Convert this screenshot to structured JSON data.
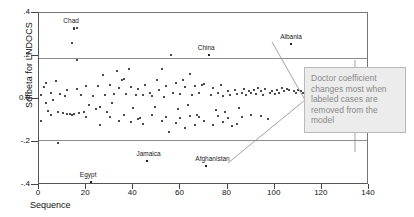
{
  "chart_data": {
    "type": "scatter",
    "title": "",
    "xlabel": "Sequence",
    "ylabel": "Sdfbeta for LNDOCS",
    "xlim": [
      0,
      140
    ],
    "ylim": [
      -0.4,
      0.4
    ],
    "xticks": [
      0,
      20,
      40,
      60,
      80,
      100,
      120,
      140
    ],
    "xtick_labels": [
      "0",
      "20",
      "40",
      "60",
      "80",
      "100",
      "120",
      "140"
    ],
    "yticks": [
      0.4,
      0.2,
      0.0,
      -0.2,
      -0.4
    ],
    "ytick_labels": [
      ".4",
      ".2",
      "0.0",
      "-.2",
      "-.4"
    ],
    "grid": false,
    "legend": "none",
    "reference_lines": [
      0.19,
      -0.19
    ],
    "annotations": [
      {
        "label": "Chad",
        "x": 15,
        "y": 0.33
      },
      {
        "label": "China",
        "x": 72,
        "y": 0.205
      },
      {
        "label": "Albania",
        "x": 107,
        "y": 0.255
      },
      {
        "label": "Jamaica",
        "x": 46,
        "y": -0.29
      },
      {
        "label": "Afghanistan",
        "x": 71,
        "y": -0.31
      },
      {
        "label": "Egypt",
        "x": 22,
        "y": -0.385
      }
    ],
    "points": [
      [
        1,
        0.02
      ],
      [
        1,
        -0.1
      ],
      [
        2,
        0.055
      ],
      [
        3,
        -0.02
      ],
      [
        3,
        0.075
      ],
      [
        4,
        -0.055
      ],
      [
        5,
        0.03
      ],
      [
        5,
        -0.075
      ],
      [
        6,
        -0.005
      ],
      [
        7,
        0.085
      ],
      [
        8,
        -0.205
      ],
      [
        8,
        -0.06
      ],
      [
        9,
        0.025
      ],
      [
        10,
        -0.065
      ],
      [
        11,
        0.015
      ],
      [
        12,
        -0.07
      ],
      [
        13,
        -0.07
      ],
      [
        14,
        -0.075
      ],
      [
        15,
        0.325
      ],
      [
        16,
        0.33
      ],
      [
        14,
        0.26
      ],
      [
        16,
        0.18
      ],
      [
        15,
        -0.07
      ],
      [
        16,
        0.045
      ],
      [
        17,
        -0.065
      ],
      [
        18,
        0.02
      ],
      [
        19,
        -0.06
      ],
      [
        20,
        0.06
      ],
      [
        21,
        -0.03
      ],
      [
        22,
        -0.385
      ],
      [
        23,
        0.015
      ],
      [
        24,
        -0.045
      ],
      [
        25,
        0.06
      ],
      [
        26,
        -0.035
      ],
      [
        27,
        0.11
      ],
      [
        28,
        0.02
      ],
      [
        29,
        -0.06
      ],
      [
        30,
        0.065
      ],
      [
        31,
        -0.02
      ],
      [
        32,
        0.025
      ],
      [
        33,
        0.13
      ],
      [
        34,
        0.05
      ],
      [
        35,
        0.09
      ],
      [
        36,
        0.095
      ],
      [
        37,
        0.025
      ],
      [
        38,
        0.14
      ],
      [
        39,
        0.055
      ],
      [
        40,
        -0.04
      ],
      [
        41,
        0.02
      ],
      [
        42,
        0.045
      ],
      [
        43,
        -0.09
      ],
      [
        44,
        0.02
      ],
      [
        45,
        0.065
      ],
      [
        46,
        -0.29
      ],
      [
        47,
        0.03
      ],
      [
        48,
        0.015
      ],
      [
        49,
        -0.035
      ],
      [
        50,
        0.09
      ],
      [
        51,
        0.04
      ],
      [
        52,
        0.14
      ],
      [
        53,
        0.01
      ],
      [
        54,
        0.06
      ],
      [
        55,
        -0.155
      ],
      [
        56,
        0.205
      ],
      [
        57,
        0.03
      ],
      [
        58,
        0.075
      ],
      [
        59,
        -0.045
      ],
      [
        60,
        0.025
      ],
      [
        61,
        0.09
      ],
      [
        62,
        0.055
      ],
      [
        63,
        -0.03
      ],
      [
        64,
        0.115
      ],
      [
        65,
        0.02
      ],
      [
        66,
        0.06
      ],
      [
        67,
        -0.075
      ],
      [
        68,
        0.03
      ],
      [
        69,
        0.065
      ],
      [
        70,
        0.07
      ],
      [
        71,
        -0.31
      ],
      [
        72,
        0.205
      ],
      [
        73,
        0.02
      ],
      [
        74,
        0.05
      ],
      [
        75,
        -0.05
      ],
      [
        76,
        0.03
      ],
      [
        77,
        0.065
      ],
      [
        78,
        0.015
      ],
      [
        79,
        -0.06
      ],
      [
        80,
        0.035
      ],
      [
        81,
        0.02
      ],
      [
        82,
        -0.125
      ],
      [
        83,
        0.04
      ],
      [
        84,
        0.025
      ],
      [
        85,
        -0.04
      ],
      [
        86,
        0.03
      ],
      [
        87,
        0.045
      ],
      [
        88,
        0.02
      ],
      [
        89,
        0.035
      ],
      [
        90,
        0.03
      ],
      [
        91,
        0.04
      ],
      [
        92,
        0.025
      ],
      [
        93,
        0.05
      ],
      [
        94,
        0.035
      ],
      [
        95,
        0.02
      ],
      [
        96,
        0.045
      ],
      [
        97,
        -0.095
      ],
      [
        98,
        0.03
      ],
      [
        99,
        0.035
      ],
      [
        100,
        0.025
      ],
      [
        101,
        0.04
      ],
      [
        102,
        0.03
      ],
      [
        103,
        0.05
      ],
      [
        104,
        0.035
      ],
      [
        105,
        0.045
      ],
      [
        106,
        0.04
      ],
      [
        107,
        0.255
      ],
      [
        108,
        0.035
      ],
      [
        109,
        0.03
      ],
      [
        110,
        0.04
      ],
      [
        111,
        0.035
      ],
      [
        112,
        0.03
      ],
      [
        113,
        0.035
      ],
      [
        114,
        0.03
      ],
      [
        115,
        0.025
      ],
      [
        116,
        0.03
      ],
      [
        117,
        0.025
      ],
      [
        118,
        0.02
      ],
      [
        119,
        0.025
      ],
      [
        120,
        0.02
      ],
      [
        121,
        0.015
      ],
      [
        122,
        0.015
      ],
      [
        123,
        0.01
      ],
      [
        124,
        0.005
      ],
      [
        125,
        0.0
      ],
      [
        26,
        -0.12
      ],
      [
        34,
        -0.1
      ],
      [
        39,
        -0.105
      ],
      [
        44,
        -0.115
      ],
      [
        52,
        -0.1
      ],
      [
        58,
        -0.11
      ],
      [
        62,
        -0.135
      ],
      [
        66,
        -0.12
      ],
      [
        70,
        -0.1
      ],
      [
        74,
        -0.12
      ],
      [
        78,
        -0.105
      ],
      [
        84,
        -0.115
      ],
      [
        12,
        0.04
      ],
      [
        20,
        -0.085
      ],
      [
        30,
        -0.085
      ],
      [
        36,
        -0.075
      ],
      [
        42,
        -0.095
      ],
      [
        48,
        -0.075
      ],
      [
        54,
        -0.085
      ],
      [
        60,
        -0.09
      ],
      [
        64,
        -0.08
      ],
      [
        68,
        -0.085
      ],
      [
        76,
        -0.08
      ],
      [
        80,
        -0.09
      ],
      [
        86,
        -0.085
      ],
      [
        90,
        -0.075
      ],
      [
        94,
        -0.08
      ]
    ]
  },
  "callout": {
    "text": "Doctor coefficient changes most when labeled cases are removed from the model"
  }
}
